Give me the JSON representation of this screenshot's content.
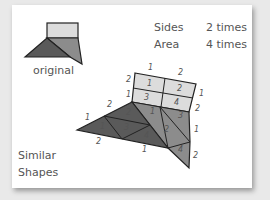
{
  "diagram": {
    "original_label": "original",
    "title_line1": "Similar",
    "title_line2": "Shapes",
    "sides_label": "Sides",
    "sides_value": "2 times",
    "area_label": "Area",
    "area_value": "4 times",
    "colors": {
      "light": "#dcdcdc",
      "mid": "#8c8c8c",
      "dark": "#5a5a5a",
      "card": "#ffffff",
      "background": "#e9e9e9"
    },
    "edge_labels": {
      "rect_top_left": "1",
      "rect_top_right": "2",
      "rect_left_top": "2",
      "rect_left_bottom": "1",
      "rect_right_top": "1",
      "rect_right_bottom": "2",
      "dark_upper_left_top": "2",
      "dark_upper_left_bottom": "1",
      "dark_bottom_left": "2",
      "dark_bottom_right": "1",
      "gray_right_top": "1",
      "gray_right_bottom": "2"
    },
    "piece_numbers": {
      "rect": [
        "1",
        "2",
        "3",
        "4"
      ],
      "dark": [
        "1",
        "2",
        "3",
        "4"
      ],
      "gray": [
        "1",
        "2",
        "3",
        "4"
      ]
    }
  }
}
